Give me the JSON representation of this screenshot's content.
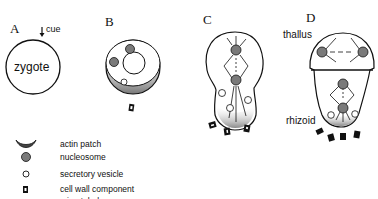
{
  "panels": [
    {
      "label": "A",
      "cue_label": "cue",
      "cell_label": "zygote"
    },
    {
      "label": "B"
    },
    {
      "label": "C"
    },
    {
      "label": "D",
      "top_label": "thallus",
      "bottom_label": "rhizoid"
    }
  ],
  "legend": {
    "items": [
      {
        "icon": "actin-patch-icon",
        "label": "actin patch"
      },
      {
        "icon": "nucleosome-icon",
        "label": "nucleosome"
      },
      {
        "icon": "secretory-vesicle-icon",
        "label": "secretory vesicle"
      },
      {
        "icon": "cell-wall-component-icon",
        "label": "cell wall component"
      },
      {
        "icon": "microtubule-icon",
        "label": "microtubule"
      }
    ]
  },
  "colors": {
    "nucleosome_fill": "#7a7a7a",
    "actin_patch_fill": "#8a8a8a",
    "outline": "#111111"
  }
}
